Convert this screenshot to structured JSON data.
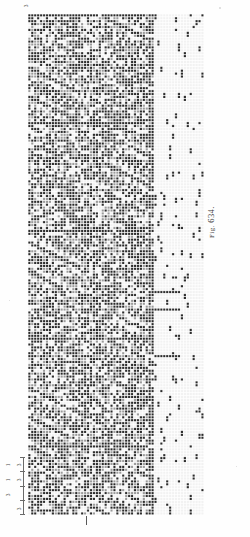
{
  "figure": {
    "caption_prefix": "Fig.",
    "caption_number": "634.",
    "caption_full": "Fig. 634."
  },
  "plate": {
    "background_color": "#fefefe",
    "ink_color": "#2b2b2b",
    "mid_color": "#9a9a9a",
    "paper_color": "#f2f2f2"
  },
  "grid": {
    "columns": 60,
    "rows": 172,
    "cell_px": 2.91,
    "origin_x": 28,
    "origin_y": 14,
    "width_px": 176,
    "height_px": 501,
    "dense_section_columns": 43,
    "sparse_section_columns": 17,
    "description": "point-paper weave design grid"
  },
  "ruler": {
    "tick_labels": [
      "3",
      "1",
      "3",
      "1",
      "3"
    ],
    "orientation": "rotated-90",
    "bracket_count": 4
  },
  "center_mark": {
    "label": "repeat-centre-tick"
  },
  "chart_data": {
    "type": "heatmap",
    "title": "Fig. 634.",
    "xlabel": "",
    "ylabel": "",
    "categories": [],
    "values": [],
    "grid": true,
    "legend": "none",
    "note": "binary point-paper weave draft: filled squares = warp up, open squares = weft up",
    "columns": 60,
    "rows": 172,
    "regions": [
      {
        "name": "figured-damask-body",
        "columns": [
          0,
          42
        ],
        "fill_ratio": 0.52,
        "motif": "zigzag-chevron-diaper"
      },
      {
        "name": "threading-draft",
        "columns": [
          43,
          59
        ],
        "fill_ratio": 0.06,
        "motif": "sparse-diagonal-points"
      }
    ]
  }
}
